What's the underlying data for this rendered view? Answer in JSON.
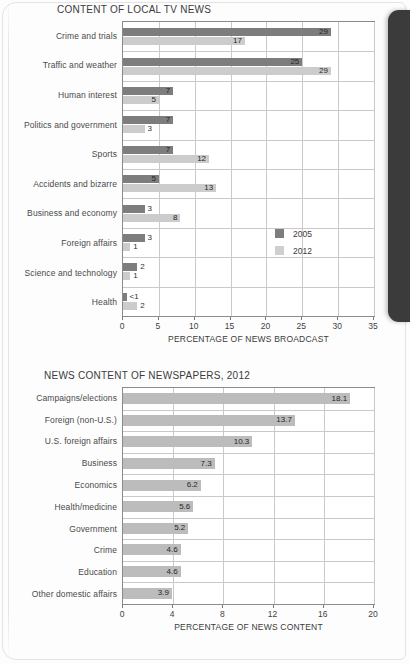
{
  "page": {
    "background_color": "#fdfdfd",
    "spine_color": "#3b3b3b"
  },
  "colors": {
    "series_2005": "#7d7d7d",
    "series_2012": "#cccccc",
    "newspaper_bar": "#bcbcbc",
    "gridline": "#c9c9c9",
    "axis": "#8a8a8a"
  },
  "charts": [
    {
      "id": "local-tv-news",
      "title": "CONTENT OF LOCAL TV NEWS",
      "xlabel": "PERCENTAGE OF NEWS BROADCAST",
      "legend": [
        {
          "label": "2005",
          "color": "#7d7d7d"
        },
        {
          "label": "2012",
          "color": "#cccccc"
        }
      ],
      "ticks": [
        "0",
        "5",
        "10",
        "15",
        "20",
        "25",
        "30",
        "35"
      ],
      "categories": [
        "Crime and trials",
        "Traffic and weather",
        "Human interest",
        "Politics and government",
        "Sports",
        "Accidents and bizarre",
        "Business and economy",
        "Foreign affairs",
        "Science and technology",
        "Health"
      ],
      "values_2005": [
        "29",
        "25",
        "7",
        "7",
        "7",
        "5",
        "3",
        "3",
        "2",
        "<1"
      ],
      "values_2012": [
        "17",
        "29",
        "5",
        "3",
        "12",
        "13",
        "8",
        "1",
        "1",
        "2"
      ]
    },
    {
      "id": "newspapers-2012",
      "title": "NEWS CONTENT OF NEWSPAPERS, 2012",
      "xlabel": "PERCENTAGE OF NEWS CONTENT",
      "ticks": [
        "0",
        "4",
        "8",
        "12",
        "16",
        "20"
      ],
      "categories": [
        "Campaigns/elections",
        "Foreign (non-U.S.)",
        "U.S. foreign affairs",
        "Business",
        "Economics",
        "Health/medicine",
        "Government",
        "Crime",
        "Education",
        "Other domestic affairs"
      ],
      "values": [
        "18.1",
        "13.7",
        "10.3",
        "7.3",
        "6.2",
        "5.6",
        "5.2",
        "4.6",
        "4.6",
        "3.9"
      ]
    }
  ],
  "chart_data": [
    {
      "type": "bar",
      "orientation": "horizontal",
      "title": "CONTENT OF LOCAL TV NEWS",
      "xlabel": "PERCENTAGE OF NEWS BROADCAST",
      "ylabel": "",
      "xlim": [
        0,
        35
      ],
      "xticks": [
        0,
        5,
        10,
        15,
        20,
        25,
        30,
        35
      ],
      "grid": true,
      "legend_position": "inside-right",
      "categories": [
        "Crime and trials",
        "Traffic and weather",
        "Human interest",
        "Politics and government",
        "Sports",
        "Accidents and bizarre",
        "Business and economy",
        "Foreign affairs",
        "Science and technology",
        "Health"
      ],
      "series": [
        {
          "name": "2005",
          "color": "#7d7d7d",
          "values": [
            29,
            25,
            7,
            7,
            7,
            5,
            3,
            3,
            2,
            0.5
          ],
          "labels": [
            "29",
            "25",
            "7",
            "7",
            "7",
            "5",
            "3",
            "3",
            "2",
            "<1"
          ]
        },
        {
          "name": "2012",
          "color": "#cccccc",
          "values": [
            17,
            29,
            5,
            3,
            12,
            13,
            8,
            1,
            1,
            2
          ],
          "labels": [
            "17",
            "29",
            "5",
            "3",
            "12",
            "13",
            "8",
            "1",
            "1",
            "2"
          ]
        }
      ]
    },
    {
      "type": "bar",
      "orientation": "horizontal",
      "title": "NEWS CONTENT OF NEWSPAPERS, 2012",
      "xlabel": "PERCENTAGE OF NEWS CONTENT",
      "ylabel": "",
      "xlim": [
        0,
        20
      ],
      "xticks": [
        0,
        4,
        8,
        12,
        16,
        20
      ],
      "grid": true,
      "legend_position": "none",
      "categories": [
        "Campaigns/elections",
        "Foreign (non-U.S.)",
        "U.S. foreign affairs",
        "Business",
        "Economics",
        "Health/medicine",
        "Government",
        "Crime",
        "Education",
        "Other domestic affairs"
      ],
      "series": [
        {
          "name": "2012",
          "color": "#bcbcbc",
          "values": [
            18.1,
            13.7,
            10.3,
            7.3,
            6.2,
            5.6,
            5.2,
            4.6,
            4.6,
            3.9
          ],
          "labels": [
            "18.1",
            "13.7",
            "10.3",
            "7.3",
            "6.2",
            "5.6",
            "5.2",
            "4.6",
            "4.6",
            "3.9"
          ]
        }
      ]
    }
  ]
}
